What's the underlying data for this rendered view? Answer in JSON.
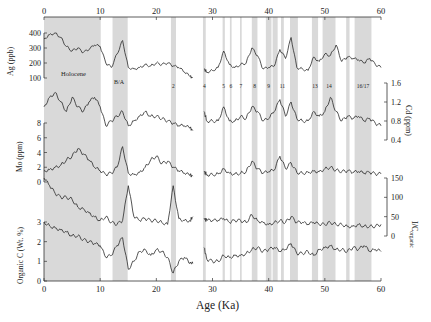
{
  "chart_data": {
    "type": "line",
    "title": "",
    "xlabel": "Age (Ka)",
    "xlim": [
      0,
      60
    ],
    "xticks": [
      0,
      10,
      20,
      30,
      40,
      50,
      60
    ],
    "shaded_intervals": [
      {
        "label": "Holocene",
        "from": 0,
        "to": 10.1
      },
      {
        "label": "B/A",
        "from": 12.2,
        "to": 14.9
      },
      {
        "label": "2",
        "from": 22.6,
        "to": 23.5
      },
      {
        "label": "4",
        "from": 28.3,
        "to": 28.8
      },
      {
        "label": "5",
        "from": 31.8,
        "to": 32.2
      },
      {
        "label": "6",
        "from": 33.1,
        "to": 33.4
      },
      {
        "label": "7",
        "from": 34.9,
        "to": 35.2
      },
      {
        "label": "8",
        "from": 37.0,
        "to": 38.0
      },
      {
        "label": "9",
        "from": 39.5,
        "to": 40.5
      },
      {
        "label": "10",
        "from": 40.7,
        "to": 41.6
      },
      {
        "label": "11",
        "from": 42.2,
        "to": 42.7
      },
      {
        "label": "12",
        "from": 43.8,
        "to": 45.2
      },
      {
        "label": "13",
        "from": 47.7,
        "to": 48.8
      },
      {
        "label": "14",
        "from": 49.6,
        "to": 51.9
      },
      {
        "label": "15",
        "from": 53.8,
        "to": 54.4
      },
      {
        "label": "16/17",
        "from": 55.3,
        "to": 58.3
      }
    ],
    "panels": [
      {
        "name": "Ag",
        "ylabel": "Ag (ppb)",
        "axis_side": "left",
        "yticks": [
          100,
          200,
          300,
          400
        ],
        "x": [
          0,
          1,
          2,
          3,
          4,
          5,
          6,
          7,
          8,
          9,
          10,
          11,
          12,
          13,
          14,
          15,
          16,
          17,
          18,
          19,
          20,
          21,
          22,
          23,
          24,
          25,
          26,
          26.5,
          28.5,
          29,
          30,
          31,
          32,
          33,
          34,
          35,
          36,
          37,
          38,
          39,
          40,
          41,
          42,
          43,
          44,
          45,
          46,
          47,
          48,
          49,
          50,
          51,
          52,
          53,
          54,
          55,
          56,
          57,
          58,
          59,
          60
        ],
        "values": [
          360,
          390,
          400,
          370,
          310,
          280,
          300,
          270,
          290,
          320,
          310,
          200,
          170,
          260,
          350,
          170,
          160,
          170,
          190,
          180,
          200,
          190,
          200,
          180,
          170,
          140,
          110,
          100,
          160,
          140,
          150,
          170,
          280,
          190,
          170,
          190,
          200,
          300,
          250,
          160,
          170,
          180,
          290,
          230,
          370,
          170,
          160,
          150,
          240,
          210,
          260,
          250,
          320,
          210,
          240,
          230,
          220,
          200,
          230,
          190,
          170
        ]
      },
      {
        "name": "Cd",
        "ylabel": "Cd (ppm)",
        "axis_side": "right",
        "yticks": [
          0.4,
          0.8,
          1.2,
          1.6
        ],
        "x": [
          0,
          1,
          2,
          3,
          4,
          5,
          6,
          7,
          8,
          9,
          10,
          11,
          12,
          13,
          14,
          15,
          16,
          17,
          18,
          19,
          20,
          21,
          22,
          23,
          24,
          25,
          26,
          26.5,
          28.5,
          29,
          30,
          31,
          32,
          33,
          34,
          35,
          36,
          37,
          38,
          39,
          40,
          41,
          42,
          43,
          44,
          45,
          46,
          47,
          48,
          49,
          50,
          51,
          52,
          53,
          54,
          55,
          56,
          57,
          58,
          59,
          60
        ],
        "values": [
          1.1,
          1.3,
          1.4,
          1.2,
          1.0,
          1.3,
          1.1,
          1.0,
          1.2,
          1.3,
          1.1,
          0.7,
          0.8,
          0.9,
          1.0,
          0.7,
          0.8,
          0.9,
          1.0,
          0.9,
          0.9,
          0.85,
          0.8,
          0.75,
          0.7,
          0.7,
          0.65,
          0.6,
          1.0,
          0.8,
          0.8,
          0.8,
          1.1,
          0.8,
          0.8,
          0.9,
          0.85,
          1.1,
          1.0,
          0.8,
          0.85,
          1.0,
          1.25,
          0.9,
          1.2,
          0.85,
          0.8,
          0.8,
          1.0,
          0.9,
          1.0,
          1.3,
          1.0,
          0.8,
          0.9,
          0.85,
          0.9,
          0.8,
          0.85,
          0.75,
          0.7
        ]
      },
      {
        "name": "Mo",
        "ylabel": "Mo (ppm)",
        "axis_side": "left",
        "yticks": [
          0,
          2,
          4,
          6,
          8
        ],
        "x": [
          0,
          1,
          2,
          3,
          4,
          5,
          6,
          7,
          8,
          9,
          10,
          11,
          12,
          13,
          14,
          15,
          16,
          17,
          18,
          19,
          20,
          21,
          22,
          23,
          24,
          25,
          26,
          26.5,
          28.5,
          29,
          30,
          31,
          32,
          33,
          34,
          35,
          36,
          37,
          38,
          39,
          40,
          41,
          42,
          43,
          44,
          45,
          46,
          47,
          48,
          49,
          50,
          51,
          52,
          53,
          54,
          55,
          56,
          57,
          58,
          59,
          60
        ],
        "values": [
          1.5,
          1.7,
          2.0,
          2.3,
          3.0,
          3.5,
          4.5,
          3.8,
          3.0,
          2.0,
          1.5,
          1.0,
          1.2,
          2.0,
          4.8,
          1.2,
          1.0,
          1.3,
          2.0,
          3.0,
          3.5,
          2.5,
          2.8,
          2.0,
          1.5,
          1.2,
          0.9,
          0.8,
          1.4,
          1.0,
          1.0,
          1.1,
          1.8,
          1.2,
          1.1,
          1.2,
          1.4,
          2.8,
          1.8,
          1.2,
          1.4,
          1.6,
          3.5,
          1.8,
          2.6,
          1.3,
          1.2,
          1.3,
          1.5,
          1.4,
          1.8,
          2.0,
          1.6,
          1.4,
          1.5,
          1.3,
          1.4,
          1.2,
          1.3,
          1.1,
          1.1
        ]
      },
      {
        "name": "I/C_organic",
        "ylabel": "I/C organic",
        "axis_side": "right",
        "yticks": [
          0,
          50,
          100,
          150
        ],
        "x": [
          0,
          1,
          2,
          3,
          4,
          5,
          6,
          7,
          8,
          9,
          10,
          11,
          12,
          13,
          14,
          15,
          16,
          17,
          18,
          19,
          20,
          21,
          22,
          23,
          24,
          25,
          26,
          26.5,
          28.5,
          29,
          30,
          31,
          32,
          33,
          34,
          35,
          36,
          37,
          38,
          39,
          40,
          41,
          42,
          43,
          44,
          45,
          46,
          47,
          48,
          49,
          50,
          51,
          52,
          53,
          54,
          55,
          56,
          57,
          58,
          59,
          60
        ],
        "values": [
          150,
          130,
          110,
          100,
          100,
          95,
          75,
          70,
          60,
          50,
          40,
          50,
          35,
          30,
          40,
          130,
          50,
          40,
          45,
          40,
          40,
          35,
          30,
          130,
          45,
          40,
          40,
          50,
          45,
          40,
          40,
          40,
          45,
          35,
          40,
          40,
          35,
          55,
          40,
          35,
          30,
          35,
          40,
          35,
          50,
          35,
          35,
          30,
          35,
          30,
          30,
          35,
          30,
          30,
          25,
          25,
          30,
          25,
          25,
          25,
          30
        ]
      },
      {
        "name": "Organic C",
        "ylabel": "Organic C (Wt. %)",
        "axis_side": "left",
        "yticks": [
          0,
          1,
          2,
          3
        ],
        "x": [
          0,
          1,
          2,
          3,
          4,
          5,
          6,
          7,
          8,
          9,
          10,
          11,
          12,
          13,
          14,
          15,
          16,
          17,
          18,
          19,
          20,
          21,
          22,
          23,
          24,
          25,
          26,
          26.5,
          28.5,
          29,
          30,
          31,
          32,
          33,
          34,
          35,
          36,
          37,
          38,
          39,
          40,
          41,
          42,
          43,
          44,
          45,
          46,
          47,
          48,
          49,
          50,
          51,
          52,
          53,
          54,
          55,
          56,
          57,
          58,
          59,
          60
        ],
        "values": [
          3.0,
          2.8,
          2.7,
          2.6,
          2.5,
          2.3,
          2.3,
          2.1,
          2.0,
          1.9,
          1.8,
          1.2,
          1.3,
          1.8,
          2.2,
          0.6,
          1.0,
          1.5,
          1.6,
          1.3,
          1.6,
          1.5,
          1.2,
          0.4,
          1.0,
          1.2,
          0.9,
          0.9,
          1.7,
          1.1,
          1.0,
          1.0,
          1.3,
          1.2,
          1.3,
          1.3,
          1.4,
          1.6,
          1.7,
          1.5,
          1.6,
          1.7,
          1.5,
          1.6,
          1.9,
          1.4,
          1.4,
          1.5,
          1.3,
          1.6,
          1.7,
          1.8,
          1.6,
          1.6,
          1.5,
          1.7,
          1.6,
          1.8,
          1.5,
          1.6,
          1.5
        ]
      }
    ]
  },
  "labels": {
    "x_axis_title": "Age (Ka)",
    "ag_axis": "Ag (ppb)",
    "cd_axis": "Cd (ppm)",
    "mo_axis": "Mo (ppm)",
    "ic_axis_main": "I/C",
    "ic_axis_sub": "organic",
    "orgc_axis": "Organic C (Wt. %)",
    "holocene": "Holocene",
    "ba": "B/A"
  },
  "colors": {
    "line": "#2a2a2a",
    "band": "#d9d9d9",
    "axis": "#333333"
  }
}
